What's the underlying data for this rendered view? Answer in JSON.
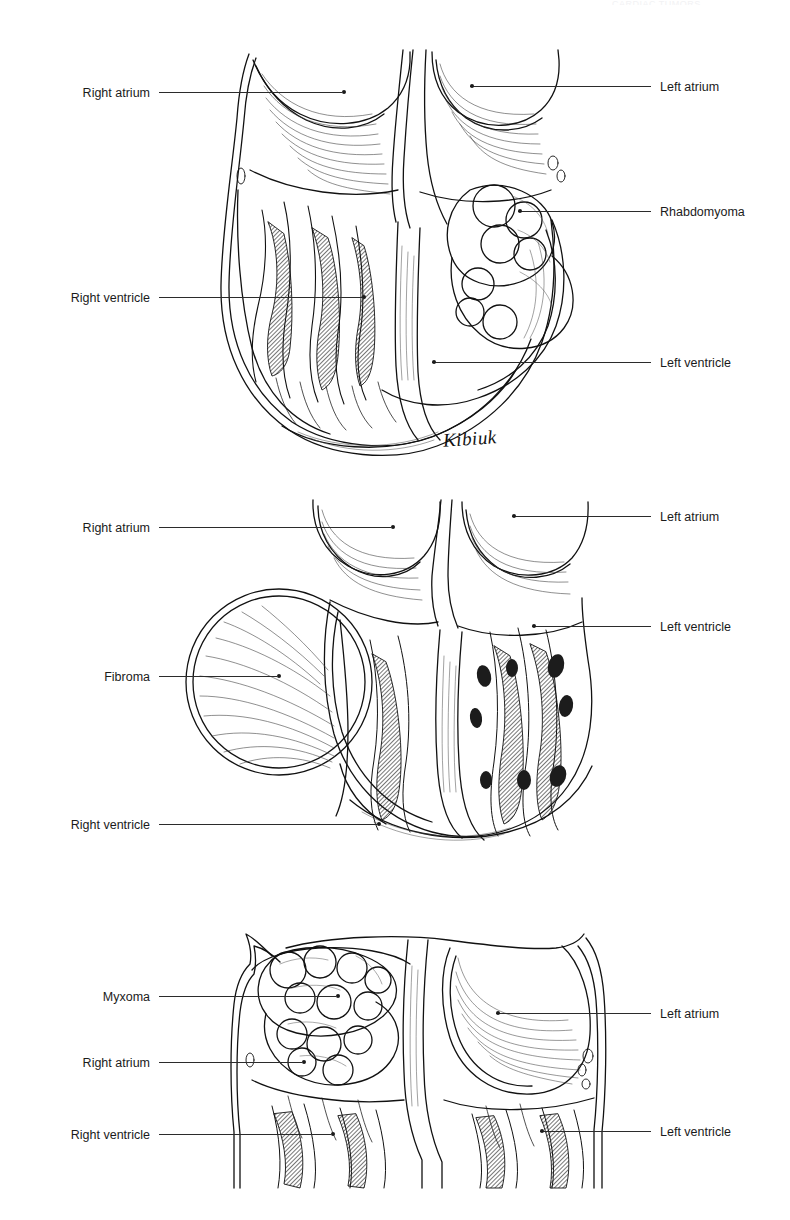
{
  "document": {
    "running_header": "CARDIAC TUMORS",
    "signature": "Kibiuk",
    "ink_color": "#1b1b1b",
    "background_color": "#ffffff",
    "leader_line_color": "#2b2b2b"
  },
  "panels": [
    {
      "id": "rhabdomyoma",
      "subject": "Rhabdomyoma",
      "labels": [
        {
          "text": "Right atrium",
          "side": "left",
          "x": 40,
          "y": 92
        },
        {
          "text": "Right ventricle",
          "side": "left",
          "x": 40,
          "y": 297
        },
        {
          "text": "Left atrium",
          "side": "right",
          "x": 660,
          "y": 86
        },
        {
          "text": "Rhabdomyoma",
          "side": "right",
          "x": 660,
          "y": 211
        },
        {
          "text": "Left ventricle",
          "side": "right",
          "x": 660,
          "y": 362
        }
      ]
    },
    {
      "id": "fibroma",
      "subject": "Fibroma",
      "labels": [
        {
          "text": "Right atrium",
          "side": "left",
          "x": 40,
          "y": 527
        },
        {
          "text": "Fibroma",
          "side": "left",
          "x": 40,
          "y": 676
        },
        {
          "text": "Right ventricle",
          "side": "left",
          "x": 40,
          "y": 824
        },
        {
          "text": "Left atrium",
          "side": "right",
          "x": 660,
          "y": 516
        },
        {
          "text": "Left ventricle",
          "side": "right",
          "x": 660,
          "y": 626
        }
      ]
    },
    {
      "id": "myxoma",
      "subject": "Myxoma",
      "labels": [
        {
          "text": "Myxoma",
          "side": "left",
          "x": 40,
          "y": 996
        },
        {
          "text": "Right atrium",
          "side": "left",
          "x": 40,
          "y": 1062
        },
        {
          "text": "Right ventricle",
          "side": "left",
          "x": 40,
          "y": 1134
        },
        {
          "text": "Left atrium",
          "side": "right",
          "x": 660,
          "y": 1013
        },
        {
          "text": "Left ventricle",
          "side": "right",
          "x": 660,
          "y": 1131
        }
      ]
    }
  ]
}
